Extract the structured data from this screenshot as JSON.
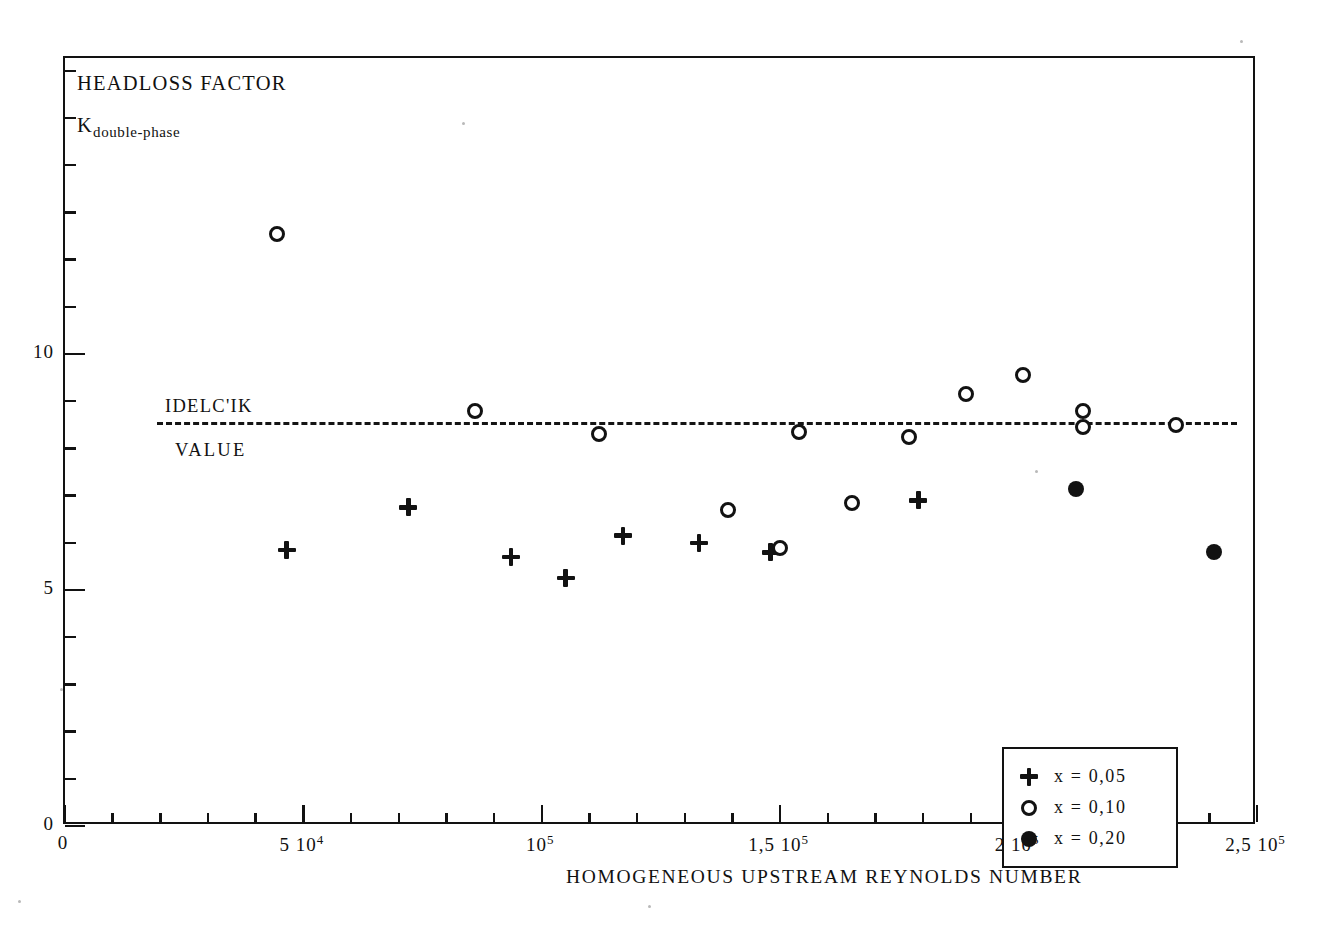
{
  "figure": {
    "y_axis_title_line1": "HEADLOSS FACTOR",
    "y_axis_title_line2_base": "K",
    "y_axis_title_line2_sub": "double-phase",
    "x_axis_title": "HOMOGENEOUS UPSTREAM REYNOLDS NUMBER",
    "reference_label_top": "IDELC'IK",
    "reference_label_bottom": "VALUE"
  },
  "legend": {
    "items": [
      {
        "marker": "plus-marker",
        "label": "x  =  0,05"
      },
      {
        "marker": "open-circle-marker",
        "label": "x  =  0,10"
      },
      {
        "marker": "filled-circle-marker",
        "label": "x  =  0,20"
      }
    ]
  },
  "axes": {
    "x_tick_labels": [
      {
        "value": 0,
        "text_html": "0"
      },
      {
        "value": 50000,
        "text_html": "5 10<sup>4</sup>"
      },
      {
        "value": 100000,
        "text_html": "10<sup>5</sup>"
      },
      {
        "value": 150000,
        "text_html": "1,5 10<sup>5</sup>"
      },
      {
        "value": 200000,
        "text_html": "2 10<sup>5</sup>"
      },
      {
        "value": 250000,
        "text_html": "2,5 10<sup>5</sup>"
      }
    ],
    "y_tick_labels": [
      {
        "value": 0,
        "text_html": "0"
      },
      {
        "value": 5,
        "text_html": "5"
      },
      {
        "value": 10,
        "text_html": "10"
      }
    ]
  },
  "chart_data": {
    "type": "scatter",
    "xlabel": "HOMOGENEOUS UPSTREAM REYNOLDS NUMBER",
    "ylabel": "HEADLOSS FACTOR K double-phase",
    "xlim": [
      0,
      250000
    ],
    "ylim": [
      0,
      16.3
    ],
    "grid": false,
    "legend_position": "bottom-right",
    "x_major_ticks": [
      0,
      50000,
      100000,
      150000,
      200000,
      250000
    ],
    "x_minor_tick_step": 10000,
    "y_major_ticks": [
      0,
      5,
      10
    ],
    "y_minor_tick_step": 1,
    "annotations": [
      {
        "name": "idelcik-reference-line",
        "type": "horizontal-dashed-line",
        "y": 8.5,
        "x_start": 6000,
        "x_end": 232000,
        "label_above": "IDELC'IK",
        "label_below": "VALUE"
      }
    ],
    "series": [
      {
        "name": "x = 0,05",
        "marker": "plus",
        "fill": "none",
        "points": [
          {
            "x": 46500,
            "y": 5.85
          },
          {
            "x": 72000,
            "y": 6.75
          },
          {
            "x": 93500,
            "y": 5.7
          },
          {
            "x": 105000,
            "y": 5.25
          },
          {
            "x": 117000,
            "y": 6.15
          },
          {
            "x": 133000,
            "y": 6.0
          },
          {
            "x": 148000,
            "y": 5.8
          },
          {
            "x": 179000,
            "y": 6.9
          }
        ]
      },
      {
        "name": "x = 0,10",
        "marker": "circle",
        "fill": "none",
        "points": [
          {
            "x": 44500,
            "y": 12.55
          },
          {
            "x": 86000,
            "y": 8.8
          },
          {
            "x": 112000,
            "y": 8.3
          },
          {
            "x": 139000,
            "y": 6.7
          },
          {
            "x": 150000,
            "y": 5.9
          },
          {
            "x": 154000,
            "y": 8.35
          },
          {
            "x": 165000,
            "y": 6.85
          },
          {
            "x": 177000,
            "y": 8.25
          },
          {
            "x": 189000,
            "y": 9.15
          },
          {
            "x": 201000,
            "y": 9.55
          },
          {
            "x": 213500,
            "y": 8.8
          },
          {
            "x": 213500,
            "y": 8.45
          },
          {
            "x": 233000,
            "y": 8.5
          }
        ]
      },
      {
        "name": "x = 0,20",
        "marker": "circle",
        "fill": "solid",
        "points": [
          {
            "x": 212000,
            "y": 7.15
          },
          {
            "x": 241000,
            "y": 5.8
          },
          {
            "x": 282000,
            "y": 9.2
          },
          {
            "x": 296000,
            "y": 7.7
          },
          {
            "x": 303000,
            "y": 9.55
          },
          {
            "x": 313000,
            "y": 10.35
          },
          {
            "x": 325000,
            "y": 10.85
          },
          {
            "x": 326000,
            "y": 10.05
          }
        ]
      }
    ]
  }
}
